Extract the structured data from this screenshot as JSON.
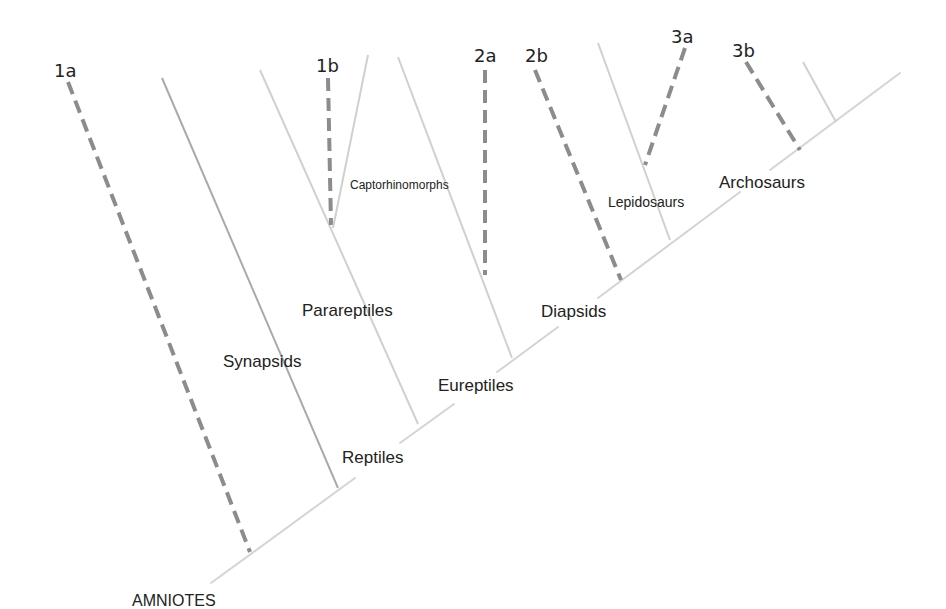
{
  "diagram": {
    "type": "cladogram",
    "root_label": "AMNIOTES",
    "colors": {
      "axis": "#d4d4d4",
      "light_branch": "#d0d0d0",
      "mid_branch": "#aaaaaa",
      "dashed_branch": "#8c8c8c",
      "text": "#222222"
    },
    "clades": [
      {
        "id": "synapsids",
        "label": "Synapsids"
      },
      {
        "id": "reptiles",
        "label": "Reptiles"
      },
      {
        "id": "parareptiles",
        "label": "Parareptiles"
      },
      {
        "id": "captorhinomorphs",
        "label": "Captorhinomorphs"
      },
      {
        "id": "eureptiles",
        "label": "Eureptiles"
      },
      {
        "id": "diapsids",
        "label": "Diapsids"
      },
      {
        "id": "lepidosaurs",
        "label": "Lepidosaurs"
      },
      {
        "id": "archosaurs",
        "label": "Archosaurs"
      }
    ],
    "markers": [
      {
        "id": "1a",
        "label": "1a"
      },
      {
        "id": "1b",
        "label": "1b"
      },
      {
        "id": "2a",
        "label": "2a"
      },
      {
        "id": "2b",
        "label": "2b"
      },
      {
        "id": "3a",
        "label": "3a"
      },
      {
        "id": "3b",
        "label": "3b"
      }
    ]
  }
}
